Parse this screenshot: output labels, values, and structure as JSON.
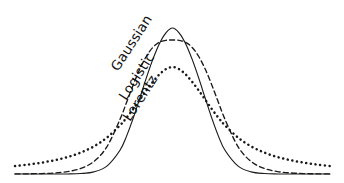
{
  "figure": {
    "title": "",
    "background_color": "#ffffff",
    "ink_color": "#1a1a1a",
    "width": 344,
    "height": 183
  },
  "labels": {
    "gaussian": "Gaussian",
    "logistic": "Logistic",
    "lorentz": "Lorentz"
  },
  "chart_data": {
    "type": "line",
    "title": "",
    "subtitle": "",
    "xlabel": "",
    "ylabel": "",
    "xlim": [
      -6,
      6
    ],
    "ylim": [
      0,
      1
    ],
    "grid": false,
    "axes_visible": false,
    "tick_labels_x": [],
    "tick_labels_y": [],
    "legend_position": "inline-on-curves",
    "annotations": [
      {
        "text": "Gaussian",
        "target_series": "Gaussian",
        "rotation_deg": -57,
        "x_px": 118,
        "y_px": 72
      },
      {
        "text": "Logistic",
        "target_series": "Logistic",
        "rotation_deg": -57,
        "x_px": 126,
        "y_px": 101
      },
      {
        "text": "Lorentz",
        "target_series": "Lorentz",
        "rotation_deg": -57,
        "x_px": 130,
        "y_px": 122
      }
    ],
    "series": [
      {
        "name": "Gaussian",
        "line_style": "solid",
        "color": "#1a1a1a",
        "peak_value": 1.0,
        "peak_x": 0,
        "formula": "exp(-x^2 / (2*s^2)), s = 1.02",
        "x": [
          -6,
          -5.5,
          -5,
          -4.5,
          -4,
          -3.5,
          -3,
          -2.5,
          -2,
          -1.75,
          -1.5,
          -1.25,
          -1,
          -0.75,
          -0.5,
          -0.25,
          0,
          0.25,
          0.5,
          0.75,
          1,
          1.25,
          1.5,
          1.75,
          2,
          2.5,
          3,
          3.5,
          4,
          4.5,
          5,
          5.5,
          6
        ],
        "y": [
          0.0,
          0.0,
          0.0,
          0.0,
          0.0003,
          0.0027,
          0.0129,
          0.0476,
          0.1432,
          0.2282,
          0.3348,
          0.4548,
          0.5772,
          0.6903,
          0.7853,
          0.8508,
          0.8797,
          0.8508,
          0.7853,
          0.6903,
          0.5772,
          0.4548,
          0.3348,
          0.2282,
          0.1432,
          0.0476,
          0.0129,
          0.0027,
          0.0003,
          0.0,
          0.0,
          0.0,
          0.0
        ]
      },
      {
        "name": "Logistic",
        "line_style": "dashed",
        "color": "#1a1a1a",
        "peak_value": 0.94,
        "peak_x": 0,
        "formula": "sech^2(x/(2*s)) / 4, s = 0.62",
        "x": [
          -6,
          -5.5,
          -5,
          -4.5,
          -4,
          -3.5,
          -3,
          -2.5,
          -2,
          -1.75,
          -1.5,
          -1.25,
          -1,
          -0.75,
          -0.5,
          -0.25,
          0,
          0.25,
          0.5,
          0.75,
          1,
          1.25,
          1.5,
          1.75,
          2,
          2.5,
          3,
          3.5,
          4,
          4.5,
          5,
          5.5,
          6
        ],
        "y": [
          0.0005,
          0.0012,
          0.0027,
          0.0063,
          0.0145,
          0.0331,
          0.0748,
          0.1636,
          0.3292,
          0.4312,
          0.5353,
          0.6305,
          0.7079,
          0.7624,
          0.7935,
          0.8053,
          0.8075,
          0.8053,
          0.7935,
          0.7624,
          0.7079,
          0.6305,
          0.5353,
          0.4312,
          0.3292,
          0.1636,
          0.0748,
          0.0331,
          0.0145,
          0.0063,
          0.0027,
          0.0012,
          0.0005
        ]
      },
      {
        "name": "Lorentz",
        "line_style": "dotted",
        "color": "#1a1a1a",
        "peak_value": 0.68,
        "peak_x": 0,
        "formula": "g^2 / (x^2 + g^2), g = 1.35",
        "x": [
          -6,
          -5.5,
          -5,
          -4.5,
          -4,
          -3.5,
          -3,
          -2.5,
          -2,
          -1.75,
          -1.5,
          -1.25,
          -1,
          -0.75,
          -0.5,
          -0.25,
          0,
          0.25,
          0.5,
          0.75,
          1,
          1.25,
          1.5,
          1.75,
          2,
          2.5,
          3,
          3.5,
          4,
          4.5,
          5,
          5.5,
          6
        ],
        "y": [
          0.048,
          0.057,
          0.068,
          0.083,
          0.102,
          0.129,
          0.166,
          0.219,
          0.293,
          0.339,
          0.391,
          0.447,
          0.503,
          0.555,
          0.6,
          0.632,
          0.644,
          0.632,
          0.6,
          0.555,
          0.503,
          0.447,
          0.391,
          0.339,
          0.293,
          0.219,
          0.166,
          0.129,
          0.102,
          0.083,
          0.068,
          0.057,
          0.048
        ]
      }
    ],
    "notes": {
      "peak_order_high_to_low": [
        "Gaussian",
        "Logistic",
        "Lorentz"
      ],
      "tail_order_high_to_low": [
        "Lorentz",
        "Logistic",
        "Gaussian"
      ],
      "crossover_points_px": [
        110,
        222
      ],
      "center_x_px": 168,
      "baseline_y_px": 174
    }
  }
}
